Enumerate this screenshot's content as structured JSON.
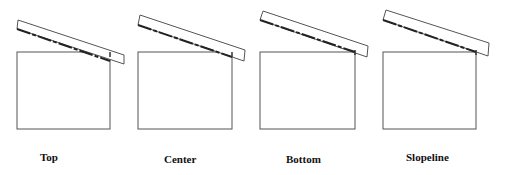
{
  "diagram": {
    "panels": [
      {
        "label": "Top",
        "label_x": 40,
        "label_y": 151
      },
      {
        "label": "Center",
        "label_x": 164,
        "label_y": 153
      },
      {
        "label": "Bottom",
        "label_x": 286,
        "label_y": 153
      },
      {
        "label": "Slopeline",
        "label_x": 406,
        "label_y": 151
      }
    ],
    "colors": {
      "stroke": "#555555",
      "dash": "#222222"
    }
  }
}
